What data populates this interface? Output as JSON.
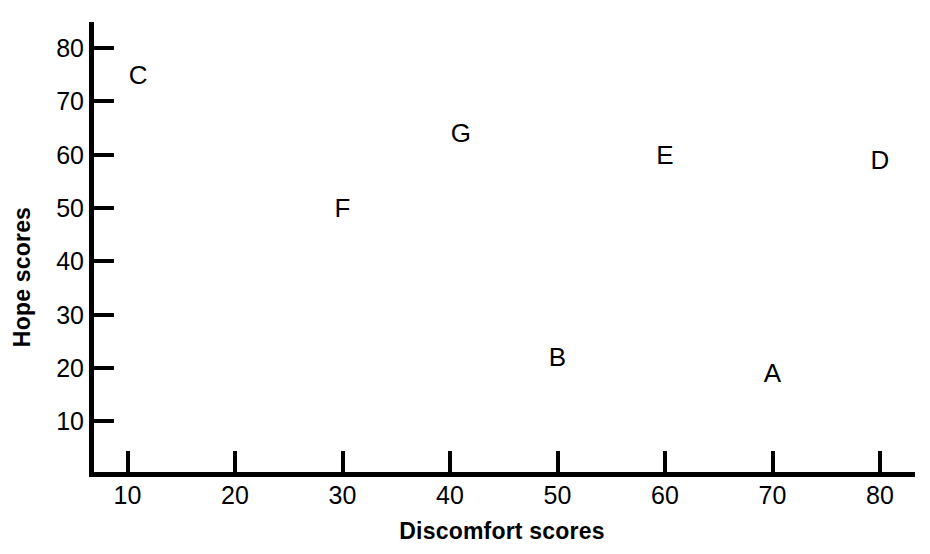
{
  "chart_data": {
    "type": "scatter",
    "title": "",
    "xlabel": "Discomfort scores",
    "ylabel": "Hope scores",
    "xlim": [
      5,
      82
    ],
    "ylim": [
      2,
      84
    ],
    "xticks": [
      10,
      20,
      30,
      40,
      50,
      60,
      70,
      80
    ],
    "xticklabels": [
      "10",
      "20",
      "30",
      "40",
      "50",
      "60",
      "70",
      "80"
    ],
    "yticks": [
      10,
      20,
      30,
      40,
      50,
      60,
      70,
      80
    ],
    "yticklabels": [
      "10",
      "20",
      "30",
      "40",
      "50",
      "60",
      "70",
      "80"
    ],
    "grid": false,
    "legend": false,
    "marker_style": "text-label",
    "point_color": "#000000",
    "axis_color": "#000000",
    "background": "#ffffff",
    "points": [
      {
        "label": "A",
        "x": 70,
        "y": 19
      },
      {
        "label": "B",
        "x": 50,
        "y": 22
      },
      {
        "label": "C",
        "x": 11,
        "y": 75
      },
      {
        "label": "D",
        "x": 80,
        "y": 59
      },
      {
        "label": "E",
        "x": 60,
        "y": 60
      },
      {
        "label": "F",
        "x": 30,
        "y": 50
      },
      {
        "label": "G",
        "x": 41,
        "y": 64
      }
    ]
  }
}
